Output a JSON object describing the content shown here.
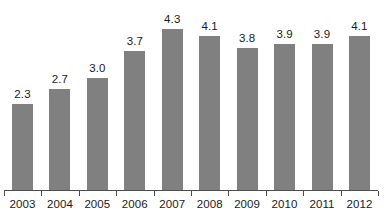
{
  "chart_data": {
    "type": "bar",
    "title": "",
    "subtitle": "",
    "xlabel": "",
    "ylabel": "",
    "categories": [
      "2003",
      "2004",
      "2005",
      "2006",
      "2007",
      "2008",
      "2009",
      "2010",
      "2011",
      "2012"
    ],
    "values": [
      2.3,
      2.7,
      3.0,
      3.7,
      4.3,
      4.1,
      3.8,
      3.9,
      3.9,
      4.1
    ],
    "value_labels": [
      "2.3",
      "2.7",
      "3.0",
      "3.7",
      "4.3",
      "4.1",
      "3.8",
      "3.9",
      "3.9",
      "4.1"
    ],
    "ylim": [
      0,
      4.85
    ],
    "grid": false,
    "legend": null,
    "legend_position": "none",
    "bar_color": "#808080",
    "axis_color": "#4d4d4d",
    "text_color": "#1a1a1a",
    "background_color": "#ffffff",
    "annotations": []
  }
}
